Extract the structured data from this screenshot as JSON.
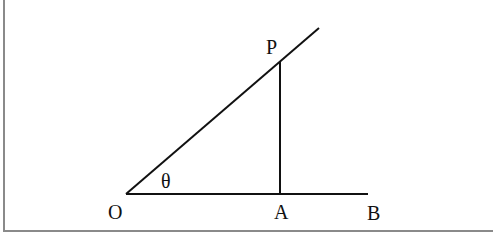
{
  "diagram": {
    "type": "right-triangle-angle",
    "points": {
      "O": {
        "label": "O",
        "x": 126,
        "y": 194
      },
      "A": {
        "label": "A",
        "x": 280,
        "y": 194
      },
      "B": {
        "label": "B",
        "x": 368,
        "y": 194
      },
      "P": {
        "label": "P",
        "x": 280,
        "y": 61
      }
    },
    "angle_label": "θ",
    "labels": {
      "O": "O",
      "A": "A",
      "B": "B",
      "P": "P",
      "theta": "θ"
    },
    "line_color": "#111111",
    "border_color": "#8a8a8a"
  }
}
